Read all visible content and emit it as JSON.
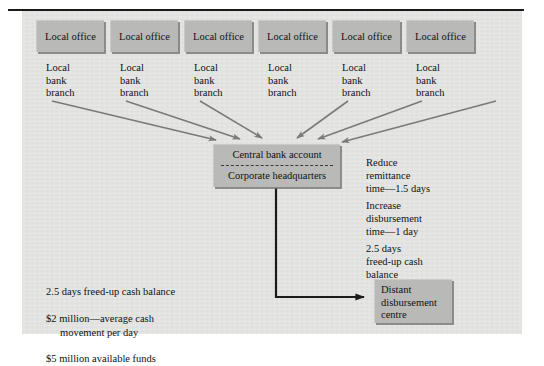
{
  "diagram": {
    "title_rule": true,
    "colors": {
      "panel_background": "#e3e3e2",
      "box_fill": "#b9b9b7",
      "box_shadow": "#6e6e6c",
      "arrow_gray": "#7a7a78",
      "arrow_dark": "#1b1b1b",
      "text": "#111111",
      "rule": "#1a1a1a"
    },
    "office_boxes": [
      {
        "label": "Local\noffice"
      },
      {
        "label": "Local\noffice"
      },
      {
        "label": "Local\noffice"
      },
      {
        "label": "Local\noffice"
      },
      {
        "label": "Local\noffice"
      },
      {
        "label": "Local\noffice"
      }
    ],
    "branch_labels": [
      {
        "label": "Local\nbank\nbranch"
      },
      {
        "label": "Local\nbank\nbranch"
      },
      {
        "label": "Local\nbank\nbranch"
      },
      {
        "label": "Local\nbank\nbranch"
      },
      {
        "label": "Local\nbank\nbranch"
      },
      {
        "label": "Local\nbank\nbranch"
      }
    ],
    "central_box": {
      "top_label": "Central bank account",
      "bottom_label": "Corporate headquarters",
      "divider": "dashed"
    },
    "distant_box": {
      "label": "Distant\ndisbursement\ncentre"
    },
    "right_notes": [
      {
        "text": "Reduce\nremittance\ntime—1.5 days"
      },
      {
        "text": "Increase\ndisbursement\ntime—1 day"
      },
      {
        "text": "2.5 days\nfreed-up cash\nbalance"
      }
    ],
    "bottom_note": {
      "line1": "2.5 days freed-up cash balance",
      "line2": "$2 million—average cash",
      "line3": "movement per day",
      "line4": "$5 million available funds"
    }
  }
}
